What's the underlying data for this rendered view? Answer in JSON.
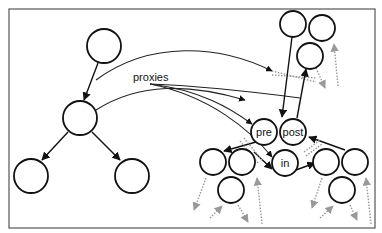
{
  "diagram": {
    "labels": {
      "proxies": "proxies",
      "pre": "pre",
      "post": "post",
      "in": "in"
    },
    "colors": {
      "node_stroke": "#111111",
      "frame_stroke": "#555555",
      "dotted_arrow": "#999999",
      "background": "#ffffff"
    },
    "left_tree": {
      "nodes": [
        "root",
        "middle",
        "bottom-left",
        "bottom-right"
      ]
    },
    "right_graph": {
      "labeled_nodes": [
        "pre",
        "post",
        "in"
      ],
      "unlabeled_nodes_count": 9
    }
  }
}
